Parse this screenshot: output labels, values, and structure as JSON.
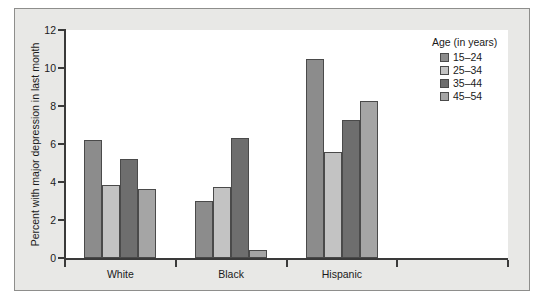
{
  "chart_data": {
    "type": "bar",
    "title": "",
    "xlabel": "",
    "ylabel": "Percent with major depression in last month",
    "categories": [
      "White",
      "Black",
      "Hispanic"
    ],
    "series": [
      {
        "name": "15–24",
        "color": "#8c8c8c",
        "values": [
          6.2,
          3.0,
          10.5
        ]
      },
      {
        "name": "25–34",
        "color": "#c3c3c3",
        "values": [
          3.85,
          3.75,
          5.6
        ]
      },
      {
        "name": "35–44",
        "color": "#6e6e6e",
        "values": [
          5.2,
          6.3,
          7.25
        ]
      },
      {
        "name": "45–54",
        "color": "#a5a5a5",
        "values": [
          3.65,
          0.4,
          8.25
        ]
      }
    ],
    "ylim": [
      0,
      12
    ],
    "yticks": [
      0,
      2,
      4,
      6,
      8,
      10,
      12
    ],
    "ytick_labels": [
      "0",
      "2",
      "4",
      "6",
      "8",
      "10",
      "12"
    ],
    "grid": false,
    "legend": {
      "position": "top-right",
      "title": "Age (in years)",
      "entries": [
        "15–24",
        "25–34",
        "35–44",
        "45–54"
      ]
    }
  },
  "colors": {
    "panel_background": "#ffffff",
    "card_background": "#e8e8e6",
    "axis": "#3a3a3a",
    "bar_outline": "#4a4a4a",
    "text": "#1a1a1a"
  }
}
